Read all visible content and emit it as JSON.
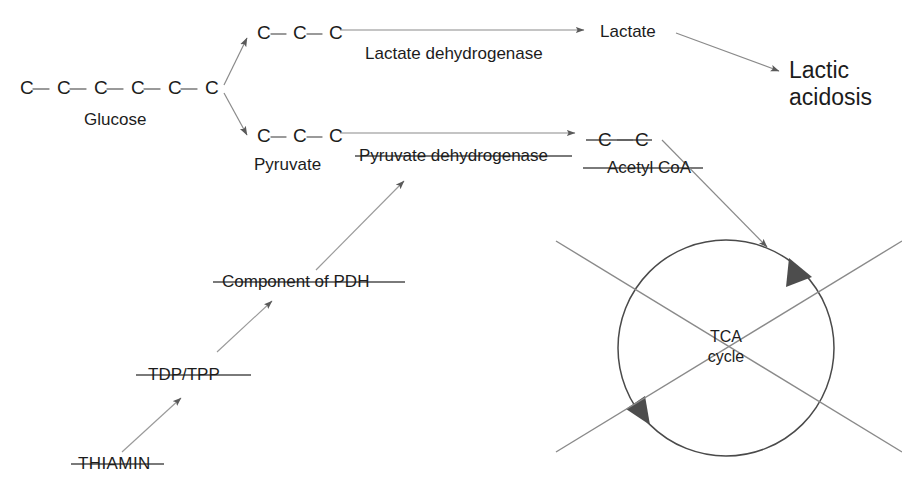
{
  "diagram": {
    "stroke_color": "#6f6f6f",
    "text_color": "#1c1c1c",
    "strike_color": "#5a5a5a",
    "arrowhead_color": "#555555",
    "background": "#ffffff"
  },
  "molecules": {
    "glucose": {
      "label": "Glucose",
      "carbons": [
        "C",
        "C",
        "C",
        "C",
        "C",
        "C"
      ],
      "carbon_count": 6
    },
    "lactate_chain": {
      "carbons": [
        "C",
        "C",
        "C"
      ],
      "carbon_count": 3
    },
    "pyruvate": {
      "label": "Pyruvate",
      "carbons": [
        "C",
        "C",
        "C"
      ],
      "carbon_count": 3
    },
    "acetyl_coa": {
      "label": "Acetyl CoA",
      "carbons": [
        "C",
        "C"
      ],
      "carbon_count": 2,
      "struck_through": true
    },
    "lactate": {
      "label": "Lactate"
    }
  },
  "enzymes": {
    "lactate_dehydrogenase": {
      "label": "Lactate dehydrogenase",
      "struck_through": false
    },
    "pyruvate_dehydrogenase": {
      "label": "Pyruvate dehydrogenase",
      "struck_through": true
    }
  },
  "cofactor_chain": {
    "component_of_pdh": {
      "label": "Component of PDH",
      "struck_through": true
    },
    "tdp_tpp": {
      "label": "TDP/TPP",
      "struck_through": true
    },
    "thiamin": {
      "label": "THIAMIN",
      "struck_through": true
    }
  },
  "outcomes": {
    "lactic_acidosis": {
      "line1": "Lactic",
      "line2": "acidosis"
    }
  },
  "tca": {
    "line1": "TCA",
    "line2": "cycle",
    "blocked": true,
    "cross_out": true
  }
}
